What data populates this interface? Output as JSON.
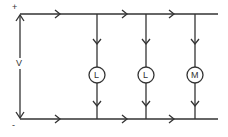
{
  "diagram": {
    "type": "parallel circuit",
    "supply": {
      "voltage_label": "V",
      "positive_label": "+",
      "negative_label": "-"
    },
    "branches": [
      {
        "component": "lamp",
        "symbol": "L"
      },
      {
        "component": "lamp",
        "symbol": "L"
      },
      {
        "component": "motor",
        "symbol": "M"
      }
    ],
    "colors": {
      "line": "#333333",
      "background": "#ffffff"
    }
  }
}
